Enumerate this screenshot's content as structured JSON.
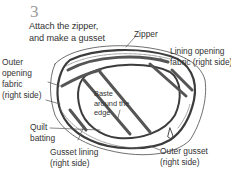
{
  "step": {
    "number": "3",
    "title_line1": "Attach the zipper,",
    "title_line2": "and make a gusset"
  },
  "labels": {
    "zipper": "Zipper",
    "lining_opening_1": "Lining opening",
    "lining_opening_2": "fabric (right side)",
    "outer_opening_1": "Outer",
    "outer_opening_2": "opening",
    "outer_opening_3": "fabric",
    "outer_opening_4": "(right side)",
    "baste_1": "Baste",
    "baste_2": "around the",
    "baste_3": "edge",
    "quilt_1": "Quilt",
    "quilt_2": "batting",
    "gusset_lining_1": "Gusset lining",
    "gusset_lining_2": "(right side)",
    "outer_gusset_1": "Outer gusset",
    "outer_gusset_2": "(right side)"
  },
  "colors": {
    "line": "#4a4a4a",
    "step_number": "#9a9a9a",
    "text": "#333333"
  }
}
